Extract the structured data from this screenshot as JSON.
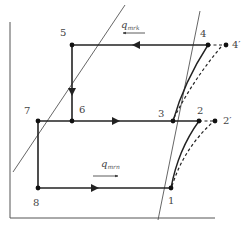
{
  "diagram": {
    "type": "thermodynamic cycle diagram (two-stage refrigeration)",
    "points": [
      {
        "id": "1",
        "label": "1",
        "x": 171,
        "y": 188
      },
      {
        "id": "2",
        "label": "2",
        "x": 199,
        "y": 121
      },
      {
        "id": "2p",
        "label": "2'",
        "x": 215,
        "y": 121
      },
      {
        "id": "3",
        "label": "3",
        "x": 173,
        "y": 121
      },
      {
        "id": "4",
        "label": "4",
        "x": 208,
        "y": 45
      },
      {
        "id": "4p",
        "label": "4'",
        "x": 226,
        "y": 45
      },
      {
        "id": "5",
        "label": "5",
        "x": 72,
        "y": 45
      },
      {
        "id": "6",
        "label": "6",
        "x": 72,
        "y": 121
      },
      {
        "id": "7",
        "label": "7",
        "x": 38,
        "y": 121
      },
      {
        "id": "8",
        "label": "8",
        "x": 38,
        "y": 188
      }
    ],
    "labels": {
      "p1": "1",
      "p2": "2",
      "p2p": "2′",
      "p3": "3",
      "p4": "4",
      "p4p": "4′",
      "p5": "5",
      "p6": "6",
      "p7": "7",
      "p8": "8"
    },
    "heat_labels": {
      "q_upper_main": "q",
      "q_upper_sub": "mrk",
      "q_lower_main": "q",
      "q_lower_sub": "mrn"
    },
    "colors": {
      "line": "#222222",
      "thin_line": "#555555",
      "label": "#444444"
    }
  }
}
